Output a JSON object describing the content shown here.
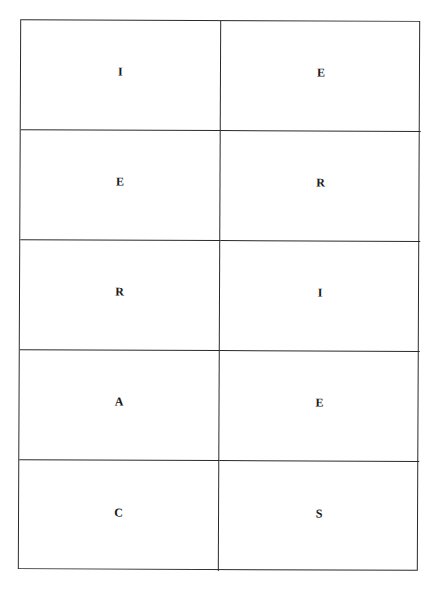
{
  "grid": {
    "rows": [
      {
        "left": "I",
        "right": "E"
      },
      {
        "left": "E",
        "right": "R"
      },
      {
        "left": "R",
        "right": "I"
      },
      {
        "left": "A",
        "right": "E"
      },
      {
        "left": "C",
        "right": "S"
      }
    ]
  },
  "colors": {
    "border": "#2a2a2a",
    "text": "#1a1a1a",
    "background": "#ffffff"
  }
}
